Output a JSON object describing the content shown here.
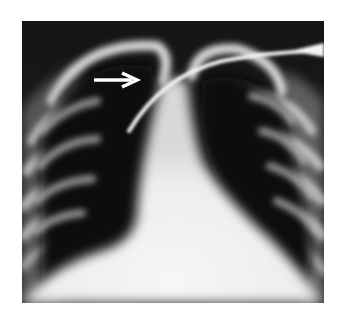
{
  "figure": {
    "type": "chest-radiograph",
    "colors": {
      "background": "#ffffff",
      "lung": "#0d0d0d",
      "bone": "#f2f2f2",
      "annotation": "#ffffff"
    },
    "annotations": [
      {
        "kind": "arrow",
        "direction": "right",
        "label": ""
      }
    ]
  }
}
